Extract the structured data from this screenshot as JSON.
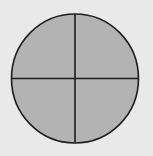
{
  "diagram": {
    "shape": "circle",
    "total_parts": 4,
    "shaded_parts": 4,
    "fraction_shaded": "4/4",
    "colors": {
      "background": "#e9e9e9",
      "fill": "#b3b3b3",
      "stroke": "#1e1e1e"
    }
  }
}
